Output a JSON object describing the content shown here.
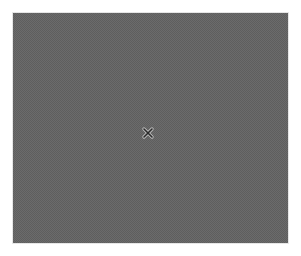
{
  "viewer": {
    "content": "image-placeholder",
    "background_color": "#5e5e5e",
    "pattern_color": "#6b6b6b"
  },
  "close_button": {
    "icon": "close-icon",
    "label": "Close",
    "color": "#2a2a2a",
    "outline_color": "#bdbdbd"
  }
}
